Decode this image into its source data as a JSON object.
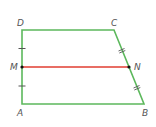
{
  "figure": {
    "type": "trapezoid-midsegment",
    "colors": {
      "shape_stroke": "#5cb85c",
      "midsegment_stroke": "#e03c31",
      "point_fill": "#111111",
      "label_color": "#555555"
    },
    "vertices": [
      {
        "name": "D",
        "x": 22,
        "y": 30,
        "label_x": 17,
        "label_y": 26
      },
      {
        "name": "C",
        "x": 114,
        "y": 30,
        "label_x": 111,
        "label_y": 26
      },
      {
        "name": "B",
        "x": 144,
        "y": 104,
        "label_x": 142,
        "label_y": 116
      },
      {
        "name": "A",
        "x": 22,
        "y": 104,
        "label_x": 17,
        "label_y": 116
      }
    ],
    "midpoints": [
      {
        "name": "M",
        "x": 22,
        "y": 67,
        "label_x": 10,
        "label_y": 70
      },
      {
        "name": "N",
        "x": 129,
        "y": 67,
        "label_x": 134,
        "label_y": 70
      }
    ],
    "segments": [
      {
        "name": "DC",
        "from": "D",
        "to": "C"
      },
      {
        "name": "CB",
        "from": "C",
        "to": "B"
      },
      {
        "name": "BA",
        "from": "B",
        "to": "A"
      },
      {
        "name": "AD",
        "from": "A",
        "to": "D"
      },
      {
        "name": "MN",
        "from": "M",
        "to": "N",
        "midsegment": true
      }
    ],
    "tick_marks": [
      {
        "segment": "DM",
        "count": 1
      },
      {
        "segment": "MA",
        "count": 1
      },
      {
        "segment": "CN",
        "count": 2
      },
      {
        "segment": "NB",
        "count": 2
      }
    ]
  }
}
